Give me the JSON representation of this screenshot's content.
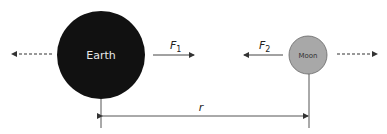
{
  "diagram": {
    "earth": {
      "label": "Earth",
      "fill": "#111111",
      "text_color": "#e8e8e8"
    },
    "moon": {
      "label": "Moon",
      "fill": "#a8a8a8",
      "text_color": "#333333"
    },
    "force1": {
      "symbol": "F",
      "subscript": "1"
    },
    "force2": {
      "symbol": "F",
      "subscript": "2"
    },
    "distance": {
      "label": "r"
    },
    "line_color": "#555555"
  }
}
